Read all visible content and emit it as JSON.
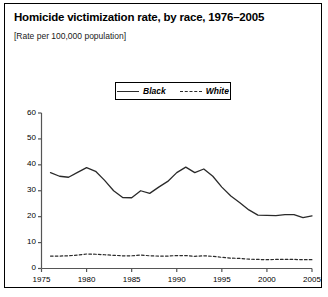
{
  "figure": {
    "title": "Homicide victimization rate, by race, 1976–2005",
    "subtitle": "[Rate per 100,000 population]"
  },
  "legend": {
    "entries": [
      {
        "label": "Black",
        "style": "solid",
        "color": "#2a2a2a"
      },
      {
        "label": "White",
        "style": "dashed",
        "color": "#2a2a2a"
      }
    ]
  },
  "axis": {
    "y_ticks": [
      "0",
      "10",
      "20",
      "30",
      "40",
      "50",
      "60"
    ],
    "x_ticks": [
      "1975",
      "1980",
      "1985",
      "1990",
      "1995",
      "2000",
      "2005"
    ]
  },
  "chart_data": {
    "type": "line",
    "title": "Homicide victimization rate, by race, 1976–2005",
    "subtitle": "[Rate per 100,000 population]",
    "xlabel": "",
    "ylabel": "Rate per 100,000 population",
    "xlim": [
      1975,
      2005
    ],
    "ylim": [
      0,
      60
    ],
    "ytick_values": [
      0,
      10,
      20,
      30,
      40,
      50,
      60
    ],
    "xtick_values": [
      1975,
      1980,
      1985,
      1990,
      1995,
      2000,
      2005
    ],
    "grid": false,
    "legend_position": "top-center",
    "x": [
      1976,
      1977,
      1978,
      1979,
      1980,
      1981,
      1982,
      1983,
      1984,
      1985,
      1986,
      1987,
      1988,
      1989,
      1990,
      1991,
      1992,
      1993,
      1994,
      1995,
      1996,
      1997,
      1998,
      1999,
      2000,
      2001,
      2002,
      2003,
      2004,
      2005
    ],
    "series": [
      {
        "name": "Black",
        "style": "solid",
        "color": "#2a2a2a",
        "values": [
          37.0,
          35.6,
          35.2,
          37.1,
          38.9,
          37.5,
          34.0,
          30.0,
          27.4,
          27.3,
          30.0,
          29.0,
          31.4,
          33.6,
          37.0,
          39.1,
          37.0,
          38.4,
          35.6,
          31.4,
          28.0,
          25.4,
          22.6,
          20.6,
          20.5,
          20.4,
          20.8,
          20.8,
          19.6,
          20.3
        ]
      },
      {
        "name": "White",
        "style": "dashed",
        "color": "#2a2a2a",
        "values": [
          4.8,
          4.8,
          4.9,
          5.2,
          5.6,
          5.5,
          5.3,
          5.1,
          4.9,
          4.9,
          5.2,
          4.9,
          4.8,
          4.8,
          5.0,
          5.0,
          4.7,
          4.9,
          4.7,
          4.3,
          4.0,
          3.9,
          3.6,
          3.5,
          3.4,
          3.5,
          3.5,
          3.5,
          3.4,
          3.4
        ]
      }
    ]
  }
}
